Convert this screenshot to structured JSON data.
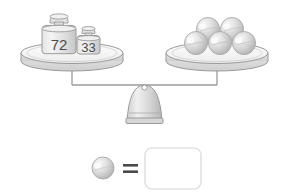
{
  "scene": {
    "title": "Balance scale puzzle",
    "background_color": "#ffffff",
    "outline_color": "#8c8c8c",
    "fill_light": "#f2f2f2",
    "fill_mid": "#d9d9d9",
    "fill_dark": "#b3b3b3",
    "text_color": "#4c4c4c",
    "balance_state": "balanced"
  },
  "left_pan": {
    "name": "left-pan",
    "weights": [
      {
        "label": "72",
        "size": "large"
      },
      {
        "label": "33",
        "size": "small"
      }
    ]
  },
  "right_pan": {
    "name": "right-pan",
    "object_name": "sphere",
    "object_count": 5,
    "rows": [
      {
        "row": "back",
        "count": 2
      },
      {
        "row": "front",
        "count": 3
      }
    ]
  },
  "equation": {
    "operand_icon": "sphere-icon",
    "equals_symbol": "=",
    "answer_value": "",
    "answer_placeholder": ""
  }
}
